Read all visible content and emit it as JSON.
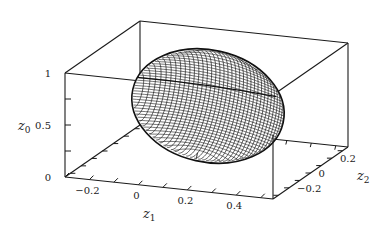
{
  "chart_data": {
    "type": "surface3d",
    "title": "",
    "surface": {
      "kind": "ellipsoid-wireframe",
      "description": "Tilted ellipsoidal surface drawn as a dense wireframe mesh",
      "color": "#1a1a1a",
      "approx_center": {
        "z1": 0.15,
        "z2": 0.0,
        "z0": 0.6
      },
      "approx_extent": {
        "z1": [
          -0.1,
          0.45
        ],
        "z2": [
          -0.3,
          0.3
        ],
        "z0": [
          0.1,
          1.0
        ]
      }
    },
    "axes": {
      "z1": {
        "label": "z",
        "subscript": "1",
        "range": [
          -0.3,
          0.55
        ],
        "ticks": [
          -0.2,
          0,
          0.2,
          0.4
        ],
        "tick_labels": [
          "−0.2",
          "0",
          "0.2",
          "0.4"
        ]
      },
      "z2": {
        "label": "z",
        "subscript": "2",
        "range": [
          -0.35,
          0.35
        ],
        "ticks": [
          -0.2,
          0,
          0.2
        ],
        "tick_labels": [
          "−0.2",
          "0",
          "0.2"
        ]
      },
      "z0": {
        "label": "z",
        "subscript": "0",
        "range": [
          0,
          1
        ],
        "ticks": [
          0,
          0.5,
          1
        ],
        "tick_labels": [
          "0",
          "0.5",
          "1"
        ]
      }
    },
    "box": true,
    "grid": false,
    "legend": null
  }
}
